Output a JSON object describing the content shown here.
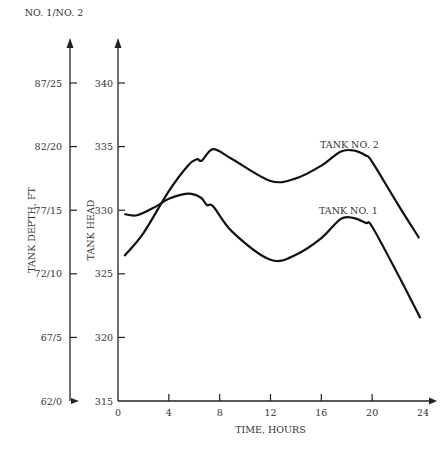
{
  "chart_data": {
    "type": "line",
    "title": "",
    "xlabel": "TIME, HOURS",
    "ylabel": "TANK HEAD",
    "ylabel_secondary": "TANK DEPTH, FT",
    "secondary_axis_header": "NO. 1/NO. 2",
    "xlim": [
      0,
      24
    ],
    "ylim": [
      315,
      340
    ],
    "x_ticks": [
      "0",
      "4",
      "8",
      "12",
      "16",
      "20",
      "24"
    ],
    "y_ticks": [
      "315",
      "320",
      "325",
      "330",
      "335",
      "340"
    ],
    "y_ticks_secondary": [
      "62/0",
      "67/5",
      "72/10",
      "77/15",
      "82/20",
      "87/25"
    ],
    "grid": false,
    "legend": "inline labels",
    "series": [
      {
        "name": "TANK NO. 2",
        "x": [
          0.5,
          2,
          4,
          5.5,
          6.2,
          6.6,
          7.5,
          9,
          12,
          14,
          16,
          17.5,
          18.5,
          19.5,
          20,
          22,
          23.7
        ],
        "values": [
          326.4,
          328.2,
          331.5,
          333.5,
          334.0,
          333.9,
          334.8,
          334.0,
          332.3,
          332.5,
          333.5,
          334.6,
          334.7,
          334.3,
          333.8,
          330.5,
          327.8
        ]
      },
      {
        "name": "TANK NO. 1",
        "x": [
          0.5,
          1.5,
          3,
          4,
          5.5,
          6.5,
          7,
          7.5,
          9,
          12,
          14,
          16,
          17.5,
          18.5,
          19.5,
          20,
          22,
          23.8
        ],
        "values": [
          329.7,
          329.6,
          330.3,
          330.9,
          331.3,
          331.0,
          330.4,
          330.3,
          328.3,
          326.1,
          326.5,
          327.8,
          329.3,
          329.4,
          329.0,
          328.7,
          325.0,
          321.5
        ]
      }
    ]
  },
  "annotations": {
    "tank2_label": "TANK NO. 2",
    "tank1_label": "TANK NO. 1"
  }
}
